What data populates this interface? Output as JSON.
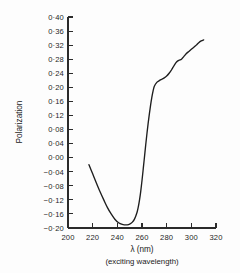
{
  "chart_data": {
    "type": "line",
    "title": "",
    "xlabel": "λ  (nm)",
    "xlabel_sub": "(exciting  wavelength)",
    "ylabel": "Polarization",
    "xlim": [
      200,
      320
    ],
    "ylim": [
      -0.2,
      0.4
    ],
    "grid": false,
    "legend": null,
    "decimal_separator": "·",
    "xticks": [
      200,
      220,
      240,
      260,
      280,
      300,
      320
    ],
    "xtick_labels": [
      "200",
      "220",
      "240",
      "260",
      "280",
      "300",
      "320"
    ],
    "yticks": [
      0.4,
      0.36,
      0.32,
      0.28,
      0.24,
      0.2,
      0.16,
      0.12,
      0.08,
      0.04,
      0.0,
      -0.04,
      -0.08,
      -0.12,
      -0.16,
      -0.2
    ],
    "ytick_labels": [
      "0·40",
      "0·36",
      "0·32",
      "0·28",
      "0·24",
      "0·20",
      "0·16",
      "0·12",
      "0·08",
      "0·04",
      "0·00",
      "−0·04",
      "−0·08",
      "−0·12",
      "−0·16",
      "−0·20"
    ],
    "series": [
      {
        "name": "polarization spectrum",
        "color": "#1e1e1e",
        "x": [
          217,
          220,
          223,
          226,
          229,
          232,
          235,
          238,
          241,
          244,
          246,
          248,
          250,
          252,
          254,
          256,
          257,
          258,
          259,
          260,
          261,
          262,
          263,
          264,
          265,
          266,
          267,
          268,
          269,
          270,
          272,
          274,
          276,
          278,
          280,
          282,
          284,
          286,
          288,
          290,
          292,
          294,
          296,
          298,
          300,
          302,
          304,
          306,
          308,
          310
        ],
        "y": [
          -0.02,
          -0.046,
          -0.072,
          -0.097,
          -0.12,
          -0.142,
          -0.16,
          -0.175,
          -0.185,
          -0.19,
          -0.191,
          -0.191,
          -0.189,
          -0.184,
          -0.174,
          -0.155,
          -0.14,
          -0.12,
          -0.095,
          -0.065,
          -0.032,
          0.002,
          0.036,
          0.068,
          0.098,
          0.125,
          0.15,
          0.172,
          0.19,
          0.203,
          0.214,
          0.219,
          0.223,
          0.227,
          0.232,
          0.24,
          0.25,
          0.262,
          0.272,
          0.277,
          0.28,
          0.288,
          0.296,
          0.302,
          0.308,
          0.314,
          0.32,
          0.327,
          0.332,
          0.335
        ]
      }
    ]
  },
  "figure": {
    "background_color": "#fdfdfd",
    "axis_color": "#2b2b2b",
    "curve_color": "#1e1e1e"
  }
}
